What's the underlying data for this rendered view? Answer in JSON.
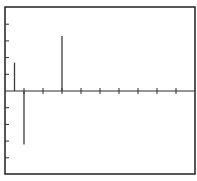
{
  "chart_data": {
    "type": "bar",
    "subtype": "stem",
    "title": "",
    "xlabel": "",
    "ylabel": "",
    "xlim": [
      0,
      10
    ],
    "ylim": [
      -5,
      5
    ],
    "xticks": [
      1,
      2,
      3,
      4,
      5,
      6,
      7,
      8,
      9
    ],
    "yticks": [
      -4,
      -3,
      -2,
      -1,
      1,
      2,
      3,
      4
    ],
    "tick_labels_shown": false,
    "grid": false,
    "legend": "none",
    "series": [
      {
        "name": "stems",
        "x": [
          0.5,
          1.0,
          3.0
        ],
        "values": [
          1.7,
          -3.2,
          3.3
        ]
      }
    ],
    "colors": {
      "frame": "#2e2e2e",
      "stem": "#3a3a3a",
      "background": "#ffffff"
    }
  }
}
